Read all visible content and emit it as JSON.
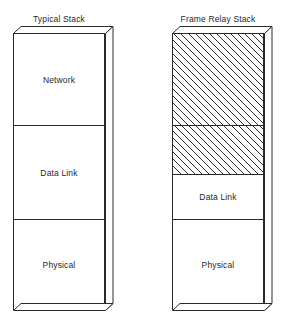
{
  "diagram": {
    "type": "protocol-stack-comparison",
    "background_color": "#ffffff",
    "line_color": "#2a2a2a",
    "hatch_fill_color": "#2a2a2a",
    "stacks": [
      {
        "id": "typical-stack",
        "title": "Typical Stack",
        "layers": [
          {
            "label": "Network",
            "hatched": false
          },
          {
            "label": "Data Link",
            "hatched": false
          },
          {
            "label": "Physical",
            "hatched": false
          }
        ]
      },
      {
        "id": "frame-relay-stack",
        "title": "Frame Relay Stack",
        "layers": [
          {
            "label": "",
            "hatched": true
          },
          {
            "label": "",
            "hatched": true
          },
          {
            "label": "Data Link",
            "hatched": false
          },
          {
            "label": "Physical",
            "hatched": false
          }
        ]
      }
    ]
  }
}
